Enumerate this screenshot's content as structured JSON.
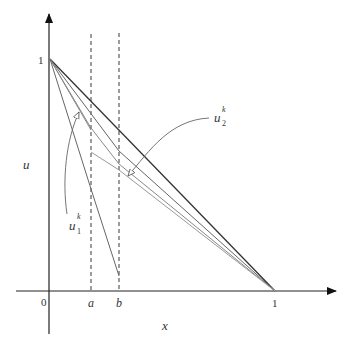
{
  "diagram": {
    "axes": {
      "x_label": "x",
      "y_label": "u",
      "origin_label": "0",
      "x_tick_a": "a",
      "x_tick_b": "b",
      "x_tick_one": "1",
      "y_tick_one": "1"
    },
    "annotations": {
      "u1": {
        "base": "u",
        "sup": "k",
        "sub": "1"
      },
      "u2": {
        "base": "u",
        "sup": "k",
        "sub": "2"
      }
    },
    "colors": {
      "axis": "#222222",
      "main_line": "#333333",
      "iterate_lines": "#777777",
      "light_lines": "#999999",
      "dashed": "#222222"
    }
  }
}
